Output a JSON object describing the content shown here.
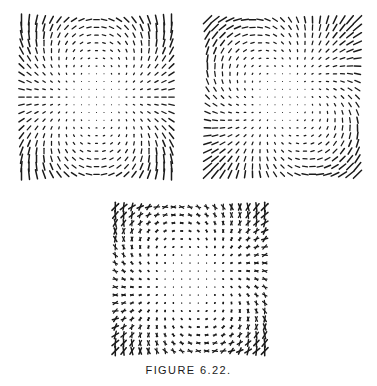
{
  "figure": {
    "caption": "FIGURE 6.22.",
    "background_color": "#ffffff",
    "stroke_color": "#1a1a1a",
    "width": 377,
    "height": 386
  },
  "chart_data": {
    "type": "scatter",
    "title": "FIGURE 6.22.",
    "xlabel": "",
    "ylabel": "",
    "panels": [
      {
        "name": "panel-left",
        "index": 1,
        "glyph": "single-segment",
        "grid_cols": 21,
        "grid_rows": 21,
        "field_mode": "cos",
        "phase_deg": 0,
        "max_length": 11.5,
        "x": 14,
        "y": 12,
        "width": 165,
        "height": 170
      },
      {
        "name": "panel-right",
        "index": 2,
        "glyph": "single-segment",
        "grid_cols": 21,
        "grid_rows": 21,
        "field_mode": "sin",
        "phase_deg": 45,
        "max_length": 11.5,
        "x": 200,
        "y": 12,
        "width": 165,
        "height": 170
      },
      {
        "name": "panel-bottom",
        "index": 3,
        "glyph": "crossed-segments",
        "grid_cols": 19,
        "grid_rows": 19,
        "field_mode": "superposed",
        "phase_deg": 0,
        "max_length": 9.5,
        "x": 107,
        "y": 199,
        "width": 166,
        "height": 160
      }
    ],
    "axis_ranges": {
      "x": [
        -1,
        1
      ],
      "y": [
        -1,
        1
      ]
    },
    "grid": false,
    "legend": false
  }
}
